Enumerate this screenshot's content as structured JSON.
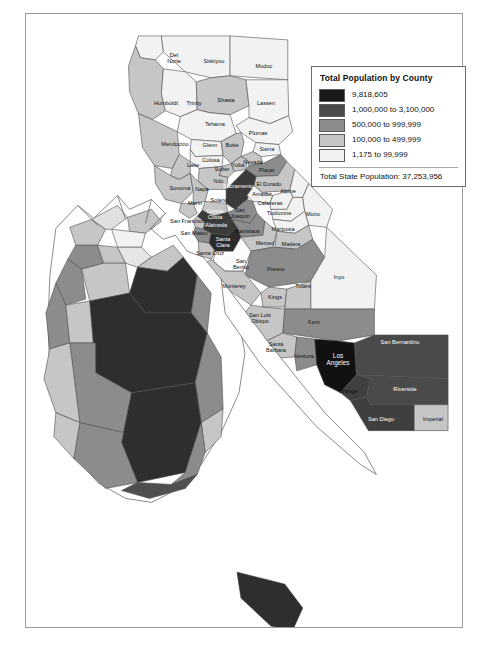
{
  "figure": {
    "kind": "choropleth-map",
    "region": "California"
  },
  "legend": {
    "title": "Total Population by County",
    "classes": [
      {
        "label": "9,818,605",
        "color": "#1a1a1a"
      },
      {
        "label": "1,000,000 to 3,100,000",
        "color": "#4a4a4a"
      },
      {
        "label": "500,000 to 999,999",
        "color": "#8c8c8c"
      },
      {
        "label": "100,000 to 499,999",
        "color": "#c6c6c6"
      },
      {
        "label": "1,175 to 99,999",
        "color": "#f2f2f2"
      }
    ],
    "total_label": "Total State Population: 37,253,956"
  },
  "chart_data": {
    "type": "map",
    "title": "Total Population by County",
    "subtitle": "Total State Population: 37,253,956",
    "legend_position": "top-right",
    "value_field": "population_class",
    "classes": [
      {
        "label": "9,818,605",
        "color": "#1a1a1a",
        "min": 9818605,
        "max": 9818605
      },
      {
        "label": "1,000,000 to 3,100,000",
        "color": "#4a4a4a",
        "min": 1000000,
        "max": 3100000
      },
      {
        "label": "500,000 to 999,999",
        "color": "#8c8c8c",
        "min": 500000,
        "max": 999999
      },
      {
        "label": "100,000 to 499,999",
        "color": "#c6c6c6",
        "min": 100000,
        "max": 499999
      },
      {
        "label": "1,175 to 99,999",
        "color": "#f2f2f2",
        "min": 1175,
        "max": 99999
      }
    ],
    "state_total": 37253956,
    "counties": [
      {
        "name": "Del Norte",
        "class": 4
      },
      {
        "name": "Siskiyou",
        "class": 4
      },
      {
        "name": "Modoc",
        "class": 4
      },
      {
        "name": "Humboldt",
        "class": 3
      },
      {
        "name": "Trinity",
        "class": 4
      },
      {
        "name": "Shasta",
        "class": 3
      },
      {
        "name": "Lassen",
        "class": 4
      },
      {
        "name": "Tehama",
        "class": 4
      },
      {
        "name": "Plumas",
        "class": 4
      },
      {
        "name": "Mendocino",
        "class": 3
      },
      {
        "name": "Glenn",
        "class": 4
      },
      {
        "name": "Butte",
        "class": 3
      },
      {
        "name": "Sierra",
        "class": 4
      },
      {
        "name": "Colusa",
        "class": 4
      },
      {
        "name": "Lake",
        "class": 3
      },
      {
        "name": "Sutter",
        "class": 3
      },
      {
        "name": "Yuba",
        "class": 3
      },
      {
        "name": "Nevada",
        "class": 3
      },
      {
        "name": "Placer",
        "class": 2
      },
      {
        "name": "Yolo",
        "class": 3
      },
      {
        "name": "El Dorado",
        "class": 3
      },
      {
        "name": "Sonoma",
        "class": 3
      },
      {
        "name": "Napa",
        "class": 3
      },
      {
        "name": "Sacramento",
        "class": 1
      },
      {
        "name": "Amador",
        "class": 4
      },
      {
        "name": "Alpine",
        "class": 4
      },
      {
        "name": "Marin",
        "class": 3
      },
      {
        "name": "Solano",
        "class": 3
      },
      {
        "name": "Calaveras",
        "class": 4
      },
      {
        "name": "Contra Costa",
        "class": 1
      },
      {
        "name": "San Joaquin",
        "class": 2
      },
      {
        "name": "Tuolumne",
        "class": 4
      },
      {
        "name": "San Francisco",
        "class": 3
      },
      {
        "name": "Alameda",
        "class": 1
      },
      {
        "name": "Stanislaus",
        "class": 2
      },
      {
        "name": "Mono",
        "class": 4
      },
      {
        "name": "San Mateo",
        "class": 2
      },
      {
        "name": "Santa Clara",
        "class": 1
      },
      {
        "name": "Mariposa",
        "class": 4
      },
      {
        "name": "Merced",
        "class": 3
      },
      {
        "name": "Madera",
        "class": 3
      },
      {
        "name": "Santa Cruz",
        "class": 3
      },
      {
        "name": "San Benito",
        "class": 4
      },
      {
        "name": "Fresno",
        "class": 2
      },
      {
        "name": "Inyo",
        "class": 4
      },
      {
        "name": "Monterey",
        "class": 3
      },
      {
        "name": "Kings",
        "class": 3
      },
      {
        "name": "Tulare",
        "class": 3
      },
      {
        "name": "San Luis Obispo",
        "class": 3
      },
      {
        "name": "Kern",
        "class": 2
      },
      {
        "name": "Santa Barbara",
        "class": 3
      },
      {
        "name": "Ventura",
        "class": 2
      },
      {
        "name": "Los Angeles",
        "class": 0
      },
      {
        "name": "San Bernardino",
        "class": 1
      },
      {
        "name": "Orange",
        "class": 1
      },
      {
        "name": "Riverside",
        "class": 1
      },
      {
        "name": "San Diego",
        "class": 1
      },
      {
        "name": "Imperial",
        "class": 3
      }
    ]
  },
  "labels": [
    {
      "name": "Del Norte",
      "text": "Del\nNorte",
      "x": 148,
      "y": 44,
      "style": ""
    },
    {
      "name": "Siskiyou",
      "text": "Siskiyou",
      "x": 188,
      "y": 47,
      "style": ""
    },
    {
      "name": "Modoc",
      "text": "Modoc",
      "x": 238,
      "y": 52,
      "style": ""
    },
    {
      "name": "Humboldt",
      "text": "Humboldt",
      "x": 140,
      "y": 89,
      "style": ""
    },
    {
      "name": "Trinity",
      "text": "Trinity",
      "x": 168,
      "y": 89,
      "style": ""
    },
    {
      "name": "Shasta",
      "text": "Shasta",
      "x": 200,
      "y": 86,
      "style": ""
    },
    {
      "name": "Lassen",
      "text": "Lassen",
      "x": 240,
      "y": 89,
      "style": ""
    },
    {
      "name": "Tehama",
      "text": "Tehama",
      "x": 189,
      "y": 110,
      "style": ""
    },
    {
      "name": "Plumas",
      "text": "Plumas",
      "x": 232,
      "y": 119,
      "style": ""
    },
    {
      "name": "Mendocino",
      "text": "Mendocino",
      "x": 149,
      "y": 130,
      "style": ""
    },
    {
      "name": "Glenn",
      "text": "Glenn",
      "x": 184,
      "y": 131,
      "style": ""
    },
    {
      "name": "Butte",
      "text": "Butte",
      "x": 206,
      "y": 131,
      "style": ""
    },
    {
      "name": "Sierra",
      "text": "Sierra",
      "x": 241,
      "y": 135,
      "style": ""
    },
    {
      "name": "Colusa",
      "text": "Colusa",
      "x": 185,
      "y": 146,
      "style": ""
    },
    {
      "name": "Lake",
      "text": "Lake",
      "x": 167,
      "y": 151,
      "style": ""
    },
    {
      "name": "Sutter",
      "text": "Sutter",
      "x": 196,
      "y": 155,
      "style": ""
    },
    {
      "name": "Yuba",
      "text": "Yuba",
      "x": 212,
      "y": 151,
      "style": ""
    },
    {
      "name": "Nevada",
      "text": "Nevada",
      "x": 227,
      "y": 148,
      "style": ""
    },
    {
      "name": "Placer",
      "text": "Placer",
      "x": 241,
      "y": 156,
      "style": ""
    },
    {
      "name": "Yolo",
      "text": "Yolo",
      "x": 192,
      "y": 167,
      "style": ""
    },
    {
      "name": "El Dorado",
      "text": "El Dorado",
      "x": 243,
      "y": 170,
      "style": ""
    },
    {
      "name": "Sonoma",
      "text": "Sonoma",
      "x": 154,
      "y": 174,
      "style": ""
    },
    {
      "name": "Napa",
      "text": "Napa",
      "x": 176,
      "y": 175,
      "style": ""
    },
    {
      "name": "Sacramento",
      "text": "Sacramento",
      "x": 212,
      "y": 172,
      "style": "light"
    },
    {
      "name": "Amador",
      "text": "Amador",
      "x": 236,
      "y": 180,
      "style": ""
    },
    {
      "name": "Alpine",
      "text": "Alpine",
      "x": 262,
      "y": 177,
      "style": ""
    },
    {
      "name": "Marin",
      "text": "Marin",
      "x": 169,
      "y": 189,
      "style": ""
    },
    {
      "name": "Solano",
      "text": "Solano",
      "x": 193,
      "y": 186,
      "style": ""
    },
    {
      "name": "Calaveras",
      "text": "Calaveras",
      "x": 244,
      "y": 189,
      "style": ""
    },
    {
      "name": "Contra Costa",
      "text": "Contra\nCosta",
      "x": 189,
      "y": 200,
      "style": "light"
    },
    {
      "name": "San Joaquin",
      "text": "San\nJoaquin",
      "x": 214,
      "y": 199,
      "style": ""
    },
    {
      "name": "Tuolumne",
      "text": "Tuolumne",
      "x": 253,
      "y": 199,
      "style": ""
    },
    {
      "name": "San Francisco",
      "text": "San Francisco",
      "x": 162,
      "y": 207,
      "style": ""
    },
    {
      "name": "Alameda",
      "text": "Alameda",
      "x": 190,
      "y": 211,
      "style": "light"
    },
    {
      "name": "Stanislaus",
      "text": "Stanislaus",
      "x": 221,
      "y": 217,
      "style": ""
    },
    {
      "name": "Mono",
      "text": "Mono",
      "x": 287,
      "y": 200,
      "style": ""
    },
    {
      "name": "San Mateo",
      "text": "San Mateo",
      "x": 168,
      "y": 219,
      "style": ""
    },
    {
      "name": "Santa Clara",
      "text": "Santa\nClara",
      "x": 197,
      "y": 228,
      "style": "light"
    },
    {
      "name": "Mariposa",
      "text": "Mariposa",
      "x": 257,
      "y": 215,
      "style": ""
    },
    {
      "name": "Merced",
      "text": "Merced",
      "x": 239,
      "y": 229,
      "style": ""
    },
    {
      "name": "Madera",
      "text": "Madera",
      "x": 265,
      "y": 230,
      "style": ""
    },
    {
      "name": "Santa Cruz",
      "text": "Santa Cruz",
      "x": 184,
      "y": 239,
      "style": ""
    },
    {
      "name": "San Benito",
      "text": "San\nBenito",
      "x": 215,
      "y": 250,
      "style": ""
    },
    {
      "name": "Fresno",
      "text": "Fresno",
      "x": 250,
      "y": 255,
      "style": ""
    },
    {
      "name": "Inyo",
      "text": "Inyo",
      "x": 313,
      "y": 263,
      "style": ""
    },
    {
      "name": "Monterey",
      "text": "Monterey",
      "x": 208,
      "y": 272,
      "style": ""
    },
    {
      "name": "Kings",
      "text": "Kings",
      "x": 249,
      "y": 283,
      "style": ""
    },
    {
      "name": "Tulare",
      "text": "Tulare",
      "x": 277,
      "y": 272,
      "style": ""
    },
    {
      "name": "San Luis Obispo",
      "text": "San Luis\nObispo",
      "x": 234,
      "y": 304,
      "style": ""
    },
    {
      "name": "Kern",
      "text": "Kern",
      "x": 288,
      "y": 308,
      "style": ""
    },
    {
      "name": "Santa Barbara",
      "text": "Santa\nBarbara",
      "x": 250,
      "y": 333,
      "style": ""
    },
    {
      "name": "Ventura",
      "text": "Ventura",
      "x": 278,
      "y": 342,
      "style": ""
    },
    {
      "name": "Los Angeles",
      "text": "Los\nAngeles",
      "x": 312,
      "y": 345,
      "style": "light big"
    },
    {
      "name": "San Bernardino",
      "text": "San Bernardino",
      "x": 374,
      "y": 328,
      "style": "light"
    },
    {
      "name": "Orange",
      "text": "Orange",
      "x": 322,
      "y": 377,
      "style": ""
    },
    {
      "name": "Riverside",
      "text": "Riverside",
      "x": 379,
      "y": 375,
      "style": "light"
    },
    {
      "name": "San Diego",
      "text": "San Diego",
      "x": 355,
      "y": 405,
      "style": "light"
    },
    {
      "name": "Imperial",
      "text": "Imperial",
      "x": 407,
      "y": 405,
      "style": ""
    }
  ]
}
